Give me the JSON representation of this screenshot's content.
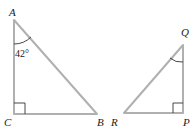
{
  "diagram": {
    "triangle_1": {
      "vertices": {
        "A": "A",
        "B": "B",
        "C": "C"
      },
      "right_angle_at": "C",
      "marked_angle": {
        "vertex": "A",
        "label": "42°"
      }
    },
    "triangle_2": {
      "vertices": {
        "P": "P",
        "Q": "Q",
        "R": "R"
      },
      "right_angle_at": "P",
      "marked_angle": {
        "vertex": "Q",
        "label": ""
      }
    },
    "colors": {
      "edge": "#b0b0b0",
      "text": "#222222"
    }
  }
}
